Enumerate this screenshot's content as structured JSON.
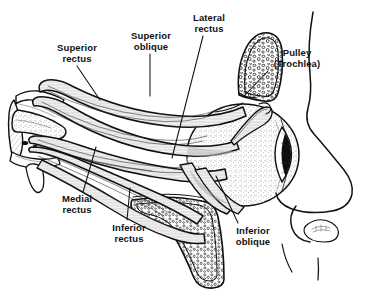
{
  "figure": {
    "background_color": "#ffffff",
    "ink_color": "#111111",
    "style": "black-and-white anatomical line drawing with stipple and hatch shading"
  },
  "labels": [
    {
      "id": "superior-rectus",
      "line1": "Superior",
      "line2": "rectus",
      "x": 46,
      "y": 42,
      "width": 62,
      "leader": {
        "x1": 77,
        "y1": 66,
        "x2": 100,
        "y2": 100
      }
    },
    {
      "id": "superior-oblique",
      "line1": "Superior",
      "line2": "oblique",
      "x": 120,
      "y": 30,
      "width": 62,
      "leader": {
        "x1": 150,
        "y1": 54,
        "x2": 150,
        "y2": 96
      }
    },
    {
      "id": "lateral-rectus",
      "line1": "Lateral",
      "line2": "rectus",
      "x": 180,
      "y": 12,
      "width": 58,
      "leader": {
        "x1": 203,
        "y1": 36,
        "x2": 172,
        "y2": 158
      }
    },
    {
      "id": "pulley-trochlea",
      "line1": "Pulley",
      "line2": "(Trochlea)",
      "x": 262,
      "y": 47,
      "width": 70,
      "leader": {
        "x1": 268,
        "y1": 71,
        "x2": 243,
        "y2": 97
      }
    },
    {
      "id": "medial-rectus",
      "line1": "Medial",
      "line2": "rectus",
      "x": 48,
      "y": 193,
      "width": 58,
      "leader": {
        "x1": 83,
        "y1": 192,
        "x2": 96,
        "y2": 147
      }
    },
    {
      "id": "inferior-rectus",
      "line1": "Inferior",
      "line2": "rectus",
      "x": 100,
      "y": 222,
      "width": 58,
      "leader": {
        "x1": 127,
        "y1": 220,
        "x2": 130,
        "y2": 188
      }
    },
    {
      "id": "inferior-oblique",
      "line1": "Inferior",
      "line2": "oblique",
      "x": 222,
      "y": 225,
      "width": 62,
      "leader": {
        "x1": 238,
        "y1": 223,
        "x2": 216,
        "y2": 176
      }
    }
  ],
  "structures": [
    {
      "id": "eyeball",
      "name": "eyeball-globe"
    },
    {
      "id": "cornea",
      "name": "cornea"
    },
    {
      "id": "orbital-bone-superior",
      "name": "superior-orbital-bone-trochlea"
    },
    {
      "id": "orbital-bone-inferior",
      "name": "inferior-orbital-bone-maxilla"
    },
    {
      "id": "orbital-apex",
      "name": "orbital-apex"
    },
    {
      "id": "nose-profile",
      "name": "nose-profile-outline"
    }
  ]
}
